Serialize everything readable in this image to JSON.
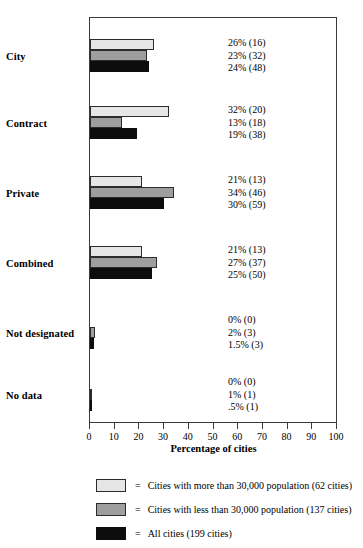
{
  "chart_data": {
    "type": "bar",
    "orientation": "horizontal",
    "title": "",
    "xlabel": "Percentage of cities",
    "ylabel": "",
    "xlim": [
      0,
      100
    ],
    "xticks": [
      "0",
      "10",
      "20",
      "30",
      "40",
      "50",
      "60",
      "70",
      "80",
      "90",
      "100"
    ],
    "grid": false,
    "legend_position": "below",
    "categories": [
      "City",
      "Contract",
      "Private",
      "Combined",
      "Not designated",
      "No data"
    ],
    "series": [
      {
        "name": "Cities with more than 30,000 population (62 cities)",
        "color": "#e6e6e6",
        "values": [
          26,
          32,
          21,
          21,
          0,
          0
        ],
        "counts": [
          16,
          20,
          13,
          13,
          0,
          0
        ],
        "labels": [
          "26% (16)",
          "32% (20)",
          "21% (13)",
          "21% (13)",
          "0% (0)",
          "0% (0)"
        ]
      },
      {
        "name": "Cities with less than 30,000 population (137 cities)",
        "color": "#9e9e9e",
        "values": [
          23,
          13,
          34,
          27,
          2,
          1
        ],
        "counts": [
          32,
          18,
          46,
          37,
          3,
          1
        ],
        "labels": [
          "23% (32)",
          "13% (18)",
          "34% (46)",
          "27% (37)",
          "2% (3)",
          "1% (1)"
        ]
      },
      {
        "name": "All cities (199 cities)",
        "color": "#0d0d0d",
        "values": [
          24,
          19,
          30,
          25,
          1.5,
          0.5
        ],
        "counts": [
          48,
          38,
          59,
          50,
          3,
          1
        ],
        "labels": [
          "24% (48)",
          "19% (38)",
          "30% (59)",
          "25% (50)",
          "1.5% (3)",
          ".5% (1)"
        ]
      }
    ]
  },
  "legend": {
    "equals": "=",
    "entries": [
      "Cities with more than 30,000 population (62 cities)",
      "Cities with less than 30,000 population (137 cities)",
      "All cities (199 cities)"
    ]
  }
}
